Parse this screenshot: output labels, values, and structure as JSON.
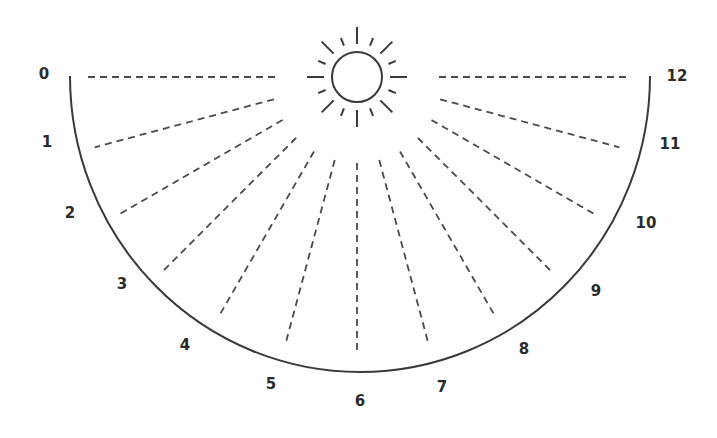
{
  "diagram": {
    "colors": {
      "stroke": "#3a3a3a",
      "dash": "#4a4a4a",
      "label": "#2b2b2b",
      "background": "#ffffff"
    },
    "sun": {
      "cx": 357,
      "cy": 77,
      "r": 25,
      "icon": "sun-icon"
    },
    "dial": {
      "cx": 360,
      "cy": 76,
      "rx": 290,
      "ry": 296
    },
    "hours": [
      {
        "label": "0",
        "x": 44,
        "y": 74
      },
      {
        "label": "1",
        "x": 47,
        "y": 142
      },
      {
        "label": "2",
        "x": 70,
        "y": 213
      },
      {
        "label": "3",
        "x": 122,
        "y": 284
      },
      {
        "label": "4",
        "x": 185,
        "y": 345
      },
      {
        "label": "5",
        "x": 271,
        "y": 384
      },
      {
        "label": "6",
        "x": 360,
        "y": 401
      },
      {
        "label": "7",
        "x": 442,
        "y": 387
      },
      {
        "label": "8",
        "x": 524,
        "y": 349
      },
      {
        "label": "9",
        "x": 596,
        "y": 291
      },
      {
        "label": "10",
        "x": 646,
        "y": 223
      },
      {
        "label": "11",
        "x": 670,
        "y": 144
      },
      {
        "label": "12",
        "x": 677,
        "y": 76
      }
    ]
  }
}
